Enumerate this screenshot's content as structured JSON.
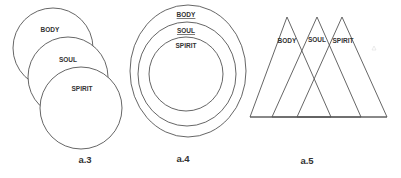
{
  "figures": [
    {
      "id": "a3",
      "caption": "a.3",
      "type": "overlapping-circles",
      "labels": [
        "BODY",
        "SOUL",
        "SPIRIT"
      ]
    },
    {
      "id": "a4",
      "caption": "a.4",
      "type": "concentric-circles",
      "labels": [
        "BODY",
        "SOUL",
        "SPIRIT"
      ]
    },
    {
      "id": "a5",
      "caption": "a.5",
      "type": "overlapping-triangles",
      "labels": [
        "BODY",
        "SOUL",
        "SPIRIT"
      ]
    }
  ],
  "colors": {
    "line": "#555555",
    "text": "#333333",
    "background": "#ffffff"
  }
}
